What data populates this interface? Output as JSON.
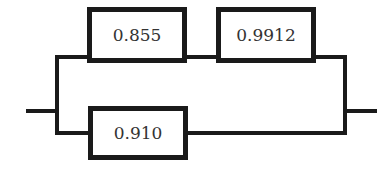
{
  "diagram": {
    "type": "reliability-block-diagram",
    "upper_branch": {
      "components": [
        {
          "label": "0.855"
        },
        {
          "label": "0.9912"
        }
      ]
    },
    "lower_branch": {
      "components": [
        {
          "label": "0.910"
        }
      ]
    },
    "colors": {
      "line": "#1a1a1a",
      "text": "#333333",
      "background": "#ffffff"
    }
  }
}
